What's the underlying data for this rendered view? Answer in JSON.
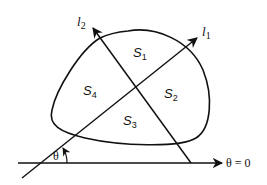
{
  "diagram": {
    "type": "region-partition",
    "regions": [
      {
        "id": "S1",
        "base": "S",
        "sub": "1"
      },
      {
        "id": "S2",
        "base": "S",
        "sub": "2"
      },
      {
        "id": "S3",
        "base": "S",
        "sub": "3"
      },
      {
        "id": "S4",
        "base": "S",
        "sub": "4"
      }
    ],
    "lines": [
      {
        "id": "l1",
        "base": "l",
        "sub": "1"
      },
      {
        "id": "l2",
        "base": "l",
        "sub": "2"
      }
    ],
    "angle_label": "θ",
    "axis_label": "θ = 0",
    "colors": {
      "stroke": "#111111",
      "background": "#ffffff"
    }
  }
}
